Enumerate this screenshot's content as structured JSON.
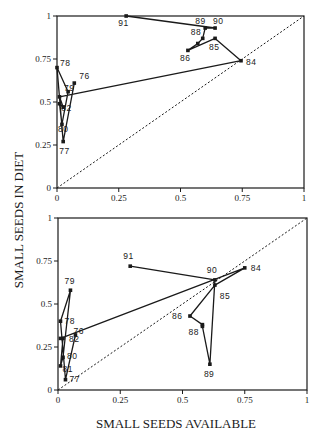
{
  "chart_data": [
    {
      "type": "line",
      "panel": "top",
      "title": "",
      "xlabel": "SMALL SEEDS AVAILABLE",
      "ylabel": "SMALL SEEDS IN DIET",
      "xlim": [
        0,
        1
      ],
      "ylim": [
        0,
        1
      ],
      "grid": false,
      "x_ticks": [
        "0",
        "0.25",
        "0.5",
        "0.75",
        "1"
      ],
      "y_ticks": [
        "0",
        "0.25",
        "0.5",
        "0.75",
        "1"
      ],
      "reference_line": {
        "type": "diagonal",
        "style": "dashed",
        "from": [
          0,
          0
        ],
        "to": [
          1,
          1
        ]
      },
      "series": [
        {
          "name": "year trajectory",
          "points": [
            {
              "label": "76",
              "x": 0.07,
              "y": 0.61
            },
            {
              "label": "77",
              "x": 0.025,
              "y": 0.27
            },
            {
              "label": "78",
              "x": 0.0,
              "y": 0.7
            },
            {
              "label": "79",
              "x": 0.045,
              "y": 0.56
            },
            {
              "label": "80",
              "x": 0.02,
              "y": 0.37
            },
            {
              "label": "81",
              "x": 0.01,
              "y": 0.49
            },
            {
              "label": "82",
              "x": 0.025,
              "y": 0.47
            },
            {
              "label": "83",
              "x": 0.01,
              "y": 0.53
            },
            {
              "label": "84",
              "x": 0.745,
              "y": 0.74
            },
            {
              "label": "85",
              "x": 0.64,
              "y": 0.87
            },
            {
              "label": "86",
              "x": 0.53,
              "y": 0.8
            },
            {
              "label": "87",
              "x": 0.57,
              "y": 0.84
            },
            {
              "label": "88",
              "x": 0.59,
              "y": 0.87
            },
            {
              "label": "89",
              "x": 0.6,
              "y": 0.93
            },
            {
              "label": "90",
              "x": 0.64,
              "y": 0.93
            },
            {
              "label": "91",
              "x": 0.28,
              "y": 1.0
            }
          ]
        }
      ],
      "visible_point_labels": [
        "76",
        "77",
        "78",
        "79",
        "80",
        "82",
        "84",
        "85",
        "86",
        "88",
        "89",
        "90",
        "91"
      ]
    },
    {
      "type": "line",
      "panel": "bottom",
      "title": "",
      "xlabel": "SMALL SEEDS AVAILABLE",
      "ylabel": "SMALL SEEDS IN DIET",
      "xlim": [
        0,
        1
      ],
      "ylim": [
        0,
        1
      ],
      "grid": false,
      "x_ticks": [
        "0",
        "0.25",
        "0.5",
        "0.75",
        "1"
      ],
      "y_ticks": [
        "0",
        "0.25",
        "0.5",
        "0.75",
        "1"
      ],
      "reference_line": {
        "type": "diagonal",
        "style": "dashed",
        "from": [
          0,
          0
        ],
        "to": [
          1,
          1
        ]
      },
      "series": [
        {
          "name": "year trajectory",
          "points": [
            {
              "label": "76",
              "x": 0.07,
              "y": 0.32
            },
            {
              "label": "77",
              "x": 0.03,
              "y": 0.06
            },
            {
              "label": "78",
              "x": 0.01,
              "y": 0.4
            },
            {
              "label": "79",
              "x": 0.05,
              "y": 0.58
            },
            {
              "label": "80",
              "x": 0.02,
              "y": 0.19
            },
            {
              "label": "81",
              "x": 0.01,
              "y": 0.14
            },
            {
              "label": "82",
              "x": 0.02,
              "y": 0.3
            },
            {
              "label": "83",
              "x": 0.01,
              "y": 0.3
            },
            {
              "label": "84",
              "x": 0.75,
              "y": 0.71
            },
            {
              "label": "85",
              "x": 0.63,
              "y": 0.61
            },
            {
              "label": "86",
              "x": 0.53,
              "y": 0.43
            },
            {
              "label": "87",
              "x": 0.58,
              "y": 0.38
            },
            {
              "label": "88",
              "x": 0.58,
              "y": 0.37
            },
            {
              "label": "89",
              "x": 0.61,
              "y": 0.15
            },
            {
              "label": "90",
              "x": 0.63,
              "y": 0.64
            },
            {
              "label": "91",
              "x": 0.29,
              "y": 0.72
            }
          ]
        }
      ],
      "visible_point_labels": [
        "76",
        "77",
        "78",
        "79",
        "80",
        "81",
        "82",
        "84",
        "85",
        "86",
        "88",
        "89",
        "90",
        "91"
      ]
    }
  ],
  "labels": {
    "x_axis_title": "SMALL SEEDS AVAILABLE",
    "y_axis_title": "SMALL SEEDS IN DIET"
  },
  "style": {
    "line_color": "#1a1a1a",
    "marker_color": "#1a1a1a",
    "background": "#ffffff"
  },
  "layout": {
    "panels": [
      {
        "left": 57,
        "right": 304,
        "top": 16,
        "bottom": 188
      },
      {
        "left": 58,
        "right": 307,
        "top": 218,
        "bottom": 390
      }
    ],
    "label_offsets": {
      "top": {
        "76": [
          5,
          -4
        ],
        "77": [
          -4,
          12
        ],
        "78": [
          3,
          -2
        ],
        "79": [
          -4,
          -1
        ],
        "80": [
          -4,
          8
        ],
        "82": [
          -2,
          4
        ],
        "84": [
          5,
          4
        ],
        "85": [
          -6,
          12
        ],
        "86": [
          -8,
          11
        ],
        "88": [
          -12,
          -3
        ],
        "89": [
          -10,
          -4
        ],
        "90": [
          -2,
          -4
        ],
        "91": [
          -8,
          10
        ]
      },
      "bottom": {
        "76": [
          -2,
          -1
        ],
        "77": [
          4,
          2
        ],
        "78": [
          4,
          3
        ],
        "79": [
          -6,
          -6
        ],
        "80": [
          4,
          2
        ],
        "81": [
          2,
          6
        ],
        "82": [
          6,
          4
        ],
        "84": [
          6,
          3
        ],
        "85": [
          5,
          14
        ],
        "86": [
          -18,
          3
        ],
        "88": [
          -14,
          9
        ],
        "89": [
          -6,
          13
        ],
        "90": [
          -8,
          -7
        ],
        "91": [
          -7,
          -7
        ]
      }
    }
  }
}
